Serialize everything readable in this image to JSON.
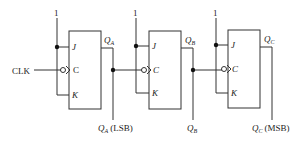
{
  "diagram": {
    "clock_label": "CLK",
    "supply_label": "1",
    "flip_flops": [
      {
        "id": "A",
        "inputs": {
          "j": "J",
          "c": "C",
          "k": "K"
        },
        "output_label": "Q",
        "output_sub": "A",
        "tap_label": "Q",
        "tap_sub": "A",
        "tap_note": "(LSB)"
      },
      {
        "id": "B",
        "inputs": {
          "j": "J",
          "c": "C",
          "k": "K"
        },
        "output_label": "Q",
        "output_sub": "B",
        "tap_label": "Q",
        "tap_sub": "B",
        "tap_note": ""
      },
      {
        "id": "C",
        "inputs": {
          "j": "J",
          "c": "C",
          "k": "K"
        },
        "output_label": "Q",
        "output_sub": "C",
        "tap_label": "Q",
        "tap_sub": "C",
        "tap_note": "(MSB)"
      }
    ]
  }
}
